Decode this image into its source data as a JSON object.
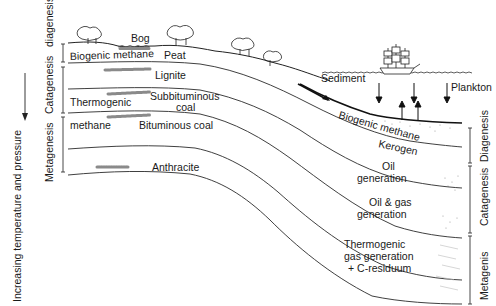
{
  "figure": {
    "axis_label": "Increasing temperature and pressure",
    "left_stages": [
      {
        "label": "diagenesis"
      },
      {
        "label": "Catagenesis"
      },
      {
        "label": "Metagenesis"
      }
    ],
    "right_stages": [
      {
        "label": "Diagenesis"
      },
      {
        "label": "Catagenesis"
      },
      {
        "label": "Metagenis"
      }
    ],
    "land_labels": {
      "bog": "Bog",
      "peat": "Peat",
      "biogenic_methane": "Biogenic methane",
      "lignite": "Lignite",
      "subbituminous_1": "Subbituminous",
      "subbituminous_2": "coal",
      "thermogenic_1": "Thermogenic",
      "thermogenic_2": "methane",
      "bituminous": "Bituminous coal",
      "anthracite": "Anthracite"
    },
    "marine_labels": {
      "sediment": "Sediment",
      "plankton": "Plankton",
      "biogenic_methane": "Biogenic methane",
      "kerogen": "Kerogen",
      "oil_1": "Oil",
      "oil_2": "generation",
      "oilgas_1": "Oil & gas",
      "oilgas_2": "generation",
      "thermo_1": "Thermogenic",
      "thermo_2": "gas generation",
      "thermo_3": "+ C-residuum"
    },
    "icons": [
      "tree-icon",
      "sailing-ship-icon",
      "down-arrow-icon",
      "up-arrow-icon",
      "wave-water-icon"
    ]
  }
}
